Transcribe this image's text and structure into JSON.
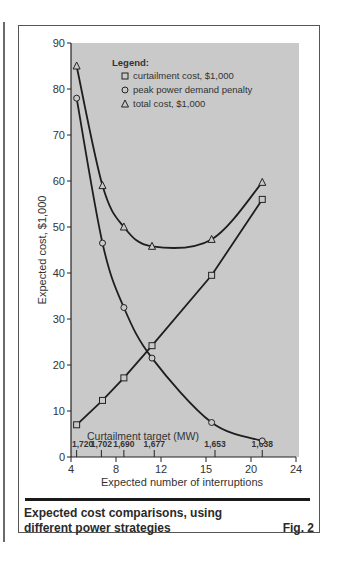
{
  "figure": {
    "caption_line1": "Expected cost comparisons, using",
    "caption_line2": "different power strategies",
    "figure_number": "Fig. 2"
  },
  "chart_data": {
    "type": "line",
    "title": "",
    "xlabel": "Expected number of interruptions",
    "ylabel": "Expected cost, $1,000",
    "xlim": [
      4,
      24
    ],
    "ylim": [
      0,
      90
    ],
    "x_ticks": [
      4,
      8,
      12,
      16,
      20,
      24
    ],
    "x_tick_labels": [
      "4",
      "8",
      "12",
      "15",
      "20",
      "24"
    ],
    "y_ticks": [
      0,
      10,
      20,
      30,
      40,
      50,
      60,
      70,
      80,
      90
    ],
    "grid": false,
    "legend_position": "upper-left inside",
    "legend_title": "Legend:",
    "secondary_axis": {
      "label": "Curtailment target (MW)",
      "x_positions": [
        4.5,
        6.7,
        8.7,
        11.4,
        16.8,
        21.0
      ],
      "tick_labels": [
        "1,720",
        "1,702",
        "1,690",
        "1,677",
        "1,653",
        "1,638"
      ]
    },
    "x": [
      4.5,
      6.8,
      8.7,
      11.2,
      16.5,
      21.0
    ],
    "series": [
      {
        "name": "curtailment cost, $1,000",
        "marker": "square",
        "values": [
          7.0,
          12.3,
          17.2,
          24.2,
          39.5,
          56.0
        ]
      },
      {
        "name": "peak power demand penalty",
        "marker": "circle",
        "values": [
          78.0,
          46.5,
          32.5,
          21.5,
          7.5,
          3.5
        ]
      },
      {
        "name": "total cost, $1,000",
        "marker": "triangle",
        "values": [
          85.0,
          59.0,
          50.0,
          45.8,
          47.3,
          59.7
        ]
      }
    ]
  },
  "colors": {
    "plot_background": "#c9c9c9",
    "line": "#1e1e1e",
    "frame": "#555555"
  }
}
